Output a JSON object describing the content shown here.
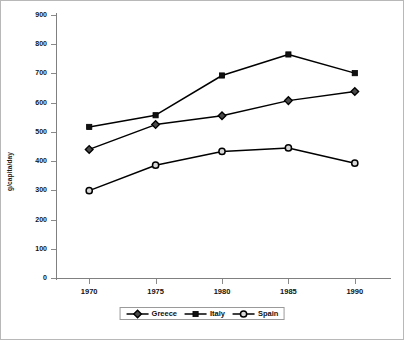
{
  "chart_data": {
    "type": "line",
    "title": "",
    "xlabel": "",
    "ylabel": "g/capita/day",
    "categories": [
      "1970",
      "1975",
      "1980",
      "1985",
      "1990"
    ],
    "x": [
      1970,
      1975,
      1980,
      1985,
      1990
    ],
    "xlim": [
      1967.5,
      1992.5
    ],
    "ylim": [
      0,
      900
    ],
    "ytick_labels": [
      "900",
      "800",
      "700",
      "600",
      "500",
      "400",
      "300",
      "200",
      "100",
      "0"
    ],
    "ytick_values": [
      900,
      800,
      700,
      600,
      500,
      400,
      300,
      200,
      100,
      0
    ],
    "grid": false,
    "legend_position": "bottom-center",
    "series": [
      {
        "name": "Greece",
        "marker": "diamond",
        "marker_style": "filled-dark",
        "color": "#000000",
        "values": [
          440,
          525,
          555,
          607,
          638
        ]
      },
      {
        "name": "Italy",
        "marker": "square",
        "marker_style": "filled",
        "color": "#000000",
        "values": [
          517,
          557,
          693,
          765,
          701
        ]
      },
      {
        "name": "Spain",
        "marker": "circle",
        "marker_style": "open",
        "color": "#000000",
        "values": [
          299,
          386,
          433,
          445,
          393
        ]
      }
    ]
  },
  "legend": {
    "entries": [
      {
        "label": "Greece",
        "marker": "diamond-marker-icon"
      },
      {
        "label": "Italy",
        "marker": "square-marker-icon"
      },
      {
        "label": "Spain",
        "marker": "circle-marker-icon"
      }
    ]
  }
}
